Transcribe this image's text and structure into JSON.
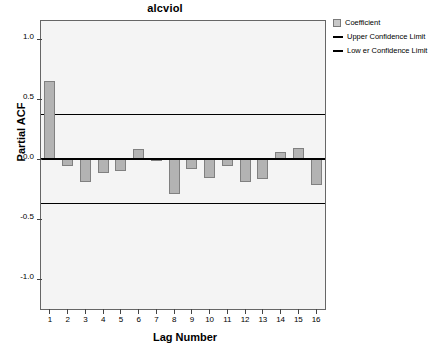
{
  "chart_data": {
    "type": "bar",
    "title": "alcviol",
    "xlabel": "Lag Number",
    "ylabel": "Partial ACF",
    "categories": [
      1,
      2,
      3,
      4,
      5,
      6,
      7,
      8,
      9,
      10,
      11,
      12,
      13,
      14,
      15,
      16
    ],
    "values": [
      0.65,
      -0.055,
      -0.19,
      -0.115,
      -0.1,
      0.08,
      -0.015,
      -0.29,
      -0.08,
      -0.16,
      -0.06,
      -0.19,
      -0.17,
      0.055,
      0.09,
      -0.22
    ],
    "series": [
      {
        "name": "Coefficient",
        "values": [
          0.65,
          -0.055,
          -0.19,
          -0.115,
          -0.1,
          0.08,
          -0.015,
          -0.29,
          -0.08,
          -0.16,
          -0.06,
          -0.19,
          -0.17,
          0.055,
          0.09,
          -0.22
        ]
      }
    ],
    "upper_confidence_limit": 0.37,
    "lower_confidence_limit": -0.37,
    "ylim": [
      -1.25,
      1.15
    ],
    "yticks": [
      1.0,
      0.5,
      0.0,
      -0.5,
      -1.0
    ],
    "ytick_labels": [
      "1.0",
      "0.5",
      "0.0",
      "-0.5",
      "-1.0"
    ],
    "xtick_labels": [
      "1",
      "2",
      "3",
      "4",
      "5",
      "6",
      "7",
      "8",
      "9",
      "10",
      "11",
      "12",
      "13",
      "14",
      "15",
      "16"
    ],
    "grid": false,
    "legend_position": "right-top",
    "colors": {
      "bar_fill": "#b3b3b3",
      "bar_stroke": "#808080",
      "line": "#000000",
      "plot_background": "#f4f4f4",
      "frame": "#666666"
    }
  },
  "legend": {
    "items": [
      {
        "label": "Coefficient",
        "marker": "box"
      },
      {
        "label": "Upper Confidence Limit",
        "marker": "line"
      },
      {
        "label": "Low er Confidence Limit",
        "marker": "line"
      }
    ]
  }
}
